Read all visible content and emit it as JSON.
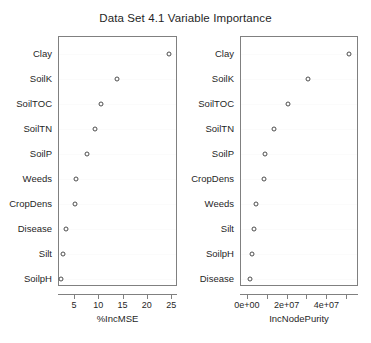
{
  "chart_data": {
    "type": "scatter",
    "title": "Data Set 4.1 Variable Importance",
    "grid": false,
    "legend": null,
    "panels": [
      {
        "name": "percent-inc-mse",
        "xlabel": "%IncMSE",
        "xlim": [
          1.7,
          26.2
        ],
        "xticks": [
          5,
          10,
          15,
          20,
          25
        ],
        "xticklabels": [
          "5",
          "10",
          "15",
          "20",
          "25"
        ],
        "categories": [
          "Clay",
          "SoilK",
          "SoilTOC",
          "SoilTN",
          "SoilP",
          "Weeds",
          "CropDens",
          "Disease",
          "Silt",
          "SoilpH"
        ],
        "values": [
          24.5,
          13.9,
          10.6,
          9.3,
          7.6,
          5.4,
          5.3,
          3.3,
          2.8,
          2.3
        ]
      },
      {
        "name": "inc-node-purity",
        "xlabel": "IncNodePurity",
        "xlim": [
          -3500000,
          56000000
        ],
        "xticks": [
          0,
          10000000,
          20000000,
          30000000,
          40000000,
          50000000
        ],
        "xticklabels": [
          "0e+00",
          "",
          "2e+07",
          "",
          "4e+07",
          ""
        ],
        "categories": [
          "Clay",
          "SoilK",
          "SoilTOC",
          "SoilTN",
          "SoilP",
          "CropDens",
          "Weeds",
          "Silt",
          "SoilpH",
          "Disease"
        ],
        "values": [
          51500000,
          31000000,
          20500000,
          13500000,
          9000000,
          8500000,
          4500000,
          3500000,
          2500000,
          1500000
        ]
      }
    ]
  }
}
